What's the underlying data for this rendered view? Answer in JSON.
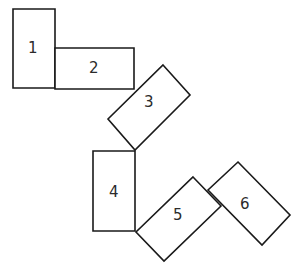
{
  "figure": {
    "canvas": {
      "width": 299,
      "height": 273
    },
    "style": {
      "background_color": "#ffffff",
      "stroke_color": "#1a1a1a",
      "fill_color": "#ffffff",
      "label_color": "#2b2b2b",
      "stroke_width": 1.6
    },
    "pieces": [
      {
        "id": "piece-1",
        "label": "1",
        "orientation": "vertical",
        "rotation_deg": 0,
        "points": "13,9 55,9 55,88 13,88",
        "label_x": 33,
        "label_y": 48
      },
      {
        "id": "piece-2",
        "label": "2",
        "orientation": "horizontal",
        "rotation_deg": 0,
        "points": "55,48 134,48 134,89 55,89",
        "label_x": 94,
        "label_y": 68
      },
      {
        "id": "piece-3",
        "label": "3",
        "orientation": "diagonal",
        "rotation_deg": -45,
        "points": "163,65 190,95 135,150 108,119",
        "label_x": 149,
        "label_y": 102
      },
      {
        "id": "piece-4",
        "label": "4",
        "orientation": "vertical",
        "rotation_deg": 0,
        "points": "93,151 135,151 135,231 93,231",
        "label_x": 114,
        "label_y": 192
      },
      {
        "id": "piece-5",
        "label": "5",
        "orientation": "diagonal",
        "rotation_deg": -45,
        "points": "193,177 221,206 164,261 136,232",
        "label_x": 178,
        "label_y": 215
      },
      {
        "id": "piece-6",
        "label": "6",
        "orientation": "diagonal",
        "rotation_deg": 45,
        "points": "238,162 290,215 262,245 208,190",
        "label_x": 245,
        "label_y": 204
      }
    ]
  }
}
